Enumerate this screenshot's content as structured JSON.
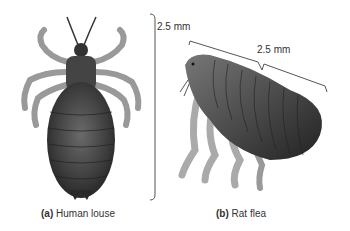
{
  "figure": {
    "panels": [
      {
        "id": "a",
        "letter": "(a)",
        "caption": "Human louse",
        "scale_label": "2.5 mm"
      },
      {
        "id": "b",
        "letter": "(b)",
        "caption": "Rat flea",
        "scale_label": "2.5 mm"
      }
    ]
  }
}
